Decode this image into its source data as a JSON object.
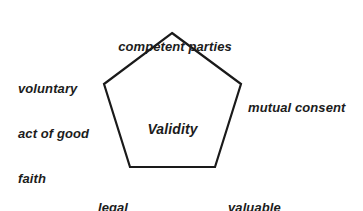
{
  "diagram": {
    "type": "pentagon-concept-diagram",
    "center_label": "Validity",
    "background_color": "#ffffff",
    "stroke_color": "#1a1a1a",
    "text_color": "#1c1c1c",
    "shape": {
      "name": "pentagon",
      "sides": 5,
      "points": "172,33 241,84 215,167 130,167 104,84"
    },
    "labels": {
      "top": "competent parties",
      "left_line1": "voluntary",
      "left_line2": "act of good",
      "left_line3": "faith",
      "right": "mutual consent",
      "bottom_left_line1": "legal",
      "bottom_left_line2": "purpose",
      "bottom_right_line1": "valuable",
      "bottom_right_line2": "consideration"
    }
  }
}
